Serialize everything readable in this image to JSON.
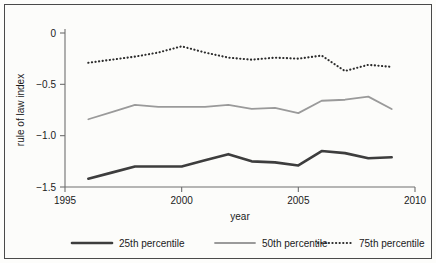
{
  "chart_data": {
    "type": "line",
    "title": "",
    "xlabel": "year",
    "ylabel": "rule of law index",
    "xlim": [
      1995,
      2010
    ],
    "ylim": [
      -1.5,
      0
    ],
    "grid": false,
    "legend_position": "bottom",
    "x": [
      1996,
      1997,
      1998,
      1999,
      2000,
      2001,
      2002,
      2003,
      2004,
      2005,
      2006,
      2007,
      2008,
      2009
    ],
    "xticks": [
      1995,
      2000,
      2005,
      2010
    ],
    "xtick_labels": [
      "1995",
      "2000",
      "2005",
      "2010"
    ],
    "yticks": [
      0,
      -0.5,
      -1.0,
      -1.5
    ],
    "ytick_labels": [
      "0",
      "−0.5",
      "−1.0",
      "−1.5"
    ],
    "series": [
      {
        "name": "25th percentile",
        "color": "#3d3d3d",
        "width": 2.6,
        "style": "solid",
        "values": [
          -1.42,
          -1.36,
          -1.3,
          -1.3,
          -1.3,
          -1.24,
          -1.18,
          -1.25,
          -1.26,
          -1.29,
          -1.15,
          -1.17,
          -1.22,
          -1.21
        ]
      },
      {
        "name": "50th percentile",
        "color": "#9a9a9a",
        "width": 1.8,
        "style": "solid",
        "values": [
          -0.84,
          -0.77,
          -0.7,
          -0.72,
          -0.72,
          -0.72,
          -0.7,
          -0.74,
          -0.73,
          -0.78,
          -0.66,
          -0.65,
          -0.62,
          -0.74
        ]
      },
      {
        "name": "75th percentile",
        "color": "#2b2b2b",
        "width": 2.1,
        "style": "dotted",
        "values": [
          -0.29,
          -0.26,
          -0.23,
          -0.19,
          -0.13,
          -0.19,
          -0.24,
          -0.26,
          -0.24,
          -0.25,
          -0.22,
          -0.37,
          -0.31,
          -0.33
        ]
      }
    ]
  },
  "legend": {
    "items": [
      {
        "label": "25th percentile"
      },
      {
        "label": "50th percentile"
      },
      {
        "label": "75th percentile"
      }
    ]
  }
}
